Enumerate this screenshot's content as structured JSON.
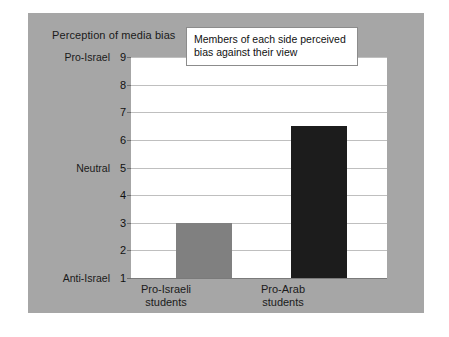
{
  "chart_data": {
    "type": "bar",
    "title": "Perception of media bias",
    "xlabel": "",
    "ylabel": "Perception of media bias",
    "categories": [
      "Pro-Israeli students",
      "Pro-Arab students"
    ],
    "values": [
      3,
      6.5
    ],
    "ylim": [
      1,
      9
    ],
    "yticks": [
      1,
      2,
      3,
      4,
      5,
      6,
      7,
      8,
      9
    ],
    "grid": true,
    "legend": "none",
    "annotations": [
      "Members of each side perceived bias against their view"
    ],
    "axis_anchors": [
      {
        "value": 9,
        "label": "Pro-Israel"
      },
      {
        "value": 5,
        "label": "Neutral"
      },
      {
        "value": 1,
        "label": "Anti-Israel"
      }
    ],
    "series": [
      {
        "name": "Perception of media bias",
        "values": [
          3,
          6.5
        ],
        "colors": [
          "#808080",
          "#1c1c1c"
        ]
      }
    ]
  },
  "chart": {
    "title": "Perception of media bias",
    "yticks": [
      "9",
      "8",
      "7",
      "6",
      "5",
      "4",
      "3",
      "2",
      "1"
    ],
    "anchors": {
      "top": "Pro-Israel",
      "middle": "Neutral",
      "bottom": "Anti-Israel"
    },
    "xlabels": [
      {
        "line1": "Pro-Israeli",
        "line2": "students"
      },
      {
        "line1": "Pro-Arab",
        "line2": "students"
      }
    ],
    "callout": {
      "line1": "Members of each side perceived",
      "line2": "bias against their view"
    },
    "colors": {
      "panel": "#a6a6a6",
      "plot": "#ffffff",
      "grid": "#bfbfbf",
      "bar_pro_israeli": "#808080",
      "bar_pro_arab": "#1c1c1c"
    }
  }
}
